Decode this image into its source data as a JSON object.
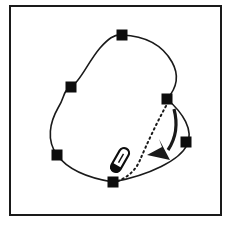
{
  "figure": {
    "background_color": "#ffffff",
    "frame": {
      "stroke_color": "#1a1a1a",
      "stroke_width": 2,
      "x": 10,
      "y": 6,
      "width": 211,
      "height": 209
    },
    "spline": {
      "stroke_color": "#1a1a1a",
      "stroke_width": 1.6,
      "closed": true,
      "path": "M 122 35 C 146 36 163 46 172 62 C 181 78 175 90 167 99 C 183 113 194 130 187 145 C 180 160 150 175 113 182 C 88 178 68 170 57 155 C 46 140 50 122 58 108 C 66 95 62 92 71 87 C 80 82 88 62 100 48 C 108 39 114 34 122 35 Z"
    },
    "control_points": {
      "fill_color": "#0d0d0d",
      "size": 11,
      "items": [
        {
          "name": "control-point-top",
          "x": 122,
          "y": 35
        },
        {
          "name": "control-point-left-upper",
          "x": 71,
          "y": 87
        },
        {
          "name": "control-point-left-lower",
          "x": 57,
          "y": 155
        },
        {
          "name": "control-point-bottom",
          "x": 113,
          "y": 182
        },
        {
          "name": "control-point-right-upper",
          "x": 167,
          "y": 99
        },
        {
          "name": "control-point-right-lower",
          "x": 186,
          "y": 142
        }
      ]
    },
    "dotted_trajectory": {
      "stroke_color": "#1a1a1a",
      "stroke_width": 2,
      "dash_pattern": "1.5 3.5",
      "from_point": "control-point-right-upper",
      "to_point": "control-point-bottom",
      "path": "M 166 106 C 156 124 146 146 140 160 C 136 170 128 177 118 181"
    },
    "drag_arrow": {
      "stroke_color": "#1a1a1a",
      "fill_color": "#1a1a1a",
      "stroke_width": 3.2,
      "shaft_path": "M 174 109 C 178 124 176 138 168 150",
      "head_points": "172 158 148 154 163 146 160 140"
    },
    "pen_tool": {
      "name": "pen-stylus",
      "body_fill": "#ffffff",
      "body_stroke": "#0d0d0d",
      "body_stroke_width": 2.2,
      "tip_fill": "#0d0d0d",
      "angle_degrees": 30,
      "center_x": 120,
      "center_y": 160,
      "length": 26,
      "width": 10
    }
  },
  "labels": {
    "figure_caption": ""
  }
}
